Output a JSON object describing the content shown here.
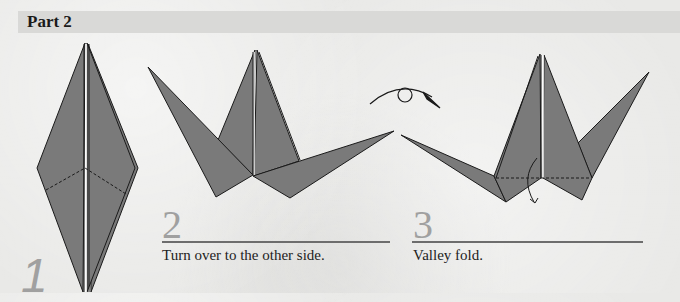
{
  "header": {
    "title": "Part 2"
  },
  "steps": [
    {
      "number": "1",
      "caption": ""
    },
    {
      "number": "2",
      "caption": "Turn over to the other side."
    },
    {
      "number": "3",
      "caption": "Valley fold."
    }
  ],
  "icons": {
    "turn_over": "turn-over-arrow-icon",
    "valley_fold": "valley-fold-arrow-icon"
  },
  "colors": {
    "paper_fill": "#7a7a7a",
    "outline": "#1a1a1a",
    "header_bg": "#d9d9d7",
    "step_number": "#a0a0a0",
    "rule": "#6d6d6d"
  }
}
